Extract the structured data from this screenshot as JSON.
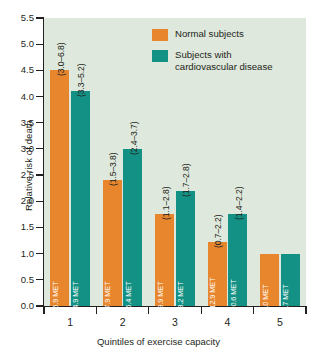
{
  "chart_data": {
    "type": "bar",
    "title": "",
    "xlabel": "Quintiles of exercise capacity",
    "ylabel": "Relative risk of death",
    "categories": [
      "1",
      "2",
      "3",
      "4",
      "5"
    ],
    "ylim": [
      0.0,
      5.5
    ],
    "ytick_labels": [
      "0.0",
      "0.5",
      "1.0",
      "1.5",
      "2.0",
      "2.5",
      "3.0",
      "3.5",
      "4.0",
      "4.5",
      "5.0",
      "5.5"
    ],
    "grid": false,
    "legend_position": "top-right",
    "series": [
      {
        "name": "Normal subjects",
        "color": "#e8862e",
        "values": [
          4.5,
          2.4,
          1.75,
          1.22,
          1.0
        ],
        "ci_labels": [
          "(3.0–6.8)",
          "(1.5–3.8)",
          "(1.1–2.8)",
          "(0.7–2.2)",
          ""
        ],
        "bar_labels": [
          "1.0–5.9 MET",
          "6.0–7.9 MET",
          "8.0–9.9 MET",
          "10.0–12.9 MET",
          "≥13.0 MET"
        ]
      },
      {
        "name": "Subjects with cardiovascular disease",
        "color": "#139184",
        "values": [
          4.1,
          3.0,
          2.2,
          1.75,
          1.0
        ],
        "ci_labels": [
          "(3.3–5.2)",
          "(2.4–3.7)",
          "(1.7–2.8)",
          "(1.4–2.2)",
          ""
        ],
        "bar_labels": [
          "1.0–4.9 MET",
          "5.0–6.4 MET",
          "6.5–8.2 MET",
          "8.3–10.6 MET",
          "≥10.7 MET"
        ]
      }
    ]
  },
  "legend": {
    "items": [
      {
        "label": "Normal subjects",
        "color": "#e8862e"
      },
      {
        "label": "Subjects with cardiovascular disease",
        "color": "#139184"
      }
    ]
  },
  "colors": {
    "plot_background": "#dfe8dc",
    "normal": "#e8862e",
    "cvd": "#139184",
    "axis": "#231f20"
  }
}
